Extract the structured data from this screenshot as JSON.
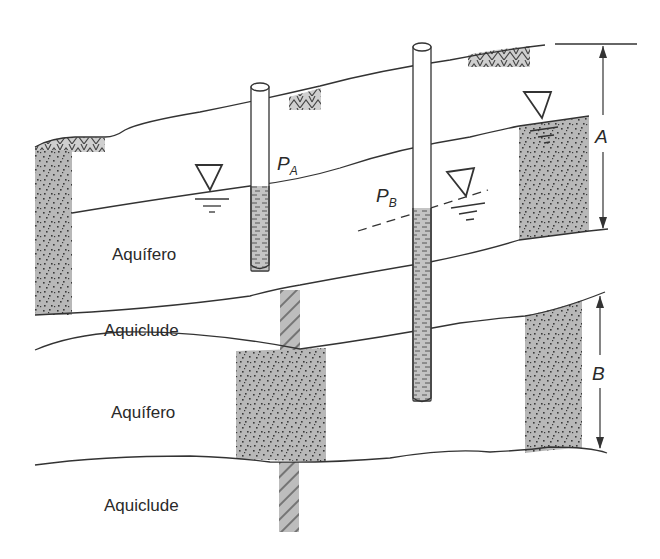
{
  "diagram": {
    "title": "",
    "layers": [
      {
        "id": "upper-aquifer",
        "label": "Aquífero",
        "type": "unconfined aquifer"
      },
      {
        "id": "upper-aquiclude",
        "label": "Aquiclude",
        "type": "aquiclude"
      },
      {
        "id": "lower-aquifer",
        "label": "Aquífero",
        "type": "confined aquifer"
      },
      {
        "id": "lower-aquiclude",
        "label": "Aquiclude",
        "type": "aquiclude"
      }
    ],
    "piezometers": [
      {
        "id": "PA",
        "label": "P",
        "subscript": "A"
      },
      {
        "id": "PB",
        "label": "P",
        "subscript": "B"
      }
    ],
    "dimensions": [
      {
        "id": "A",
        "label": "A"
      },
      {
        "id": "B",
        "label": "B"
      }
    ],
    "colors": {
      "sand_fill": "#b8b8b8",
      "dot": "#3a3a3a",
      "line": "#333333",
      "background": "#ffffff"
    }
  }
}
